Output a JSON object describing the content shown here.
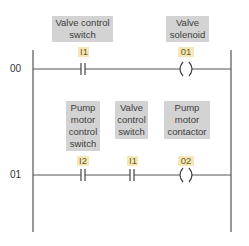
{
  "diagram": {
    "type": "ladder-logic",
    "colors": {
      "rail": "#555555",
      "label_box": "#d3d3d3",
      "label_text": "#3d3d3d",
      "address_box": "#f6e7b8",
      "address_text": "#6b5a1e"
    },
    "rungs": [
      {
        "number": "00",
        "elements": [
          {
            "kind": "contact-NO",
            "address": "I1",
            "description": "Valve control\nswitch"
          },
          {
            "kind": "coil",
            "address": "01",
            "description": "Valve\nsolenoid"
          }
        ]
      },
      {
        "number": "01",
        "elements": [
          {
            "kind": "contact-NO",
            "address": "I2",
            "description": "Pump\nmotor\ncontrol\nswitch"
          },
          {
            "kind": "contact-NO",
            "address": "I1",
            "description": "Valve\ncontrol\nswitch"
          },
          {
            "kind": "coil",
            "address": "02",
            "description": "Pump\nmotor\ncontactor"
          }
        ]
      }
    ]
  }
}
